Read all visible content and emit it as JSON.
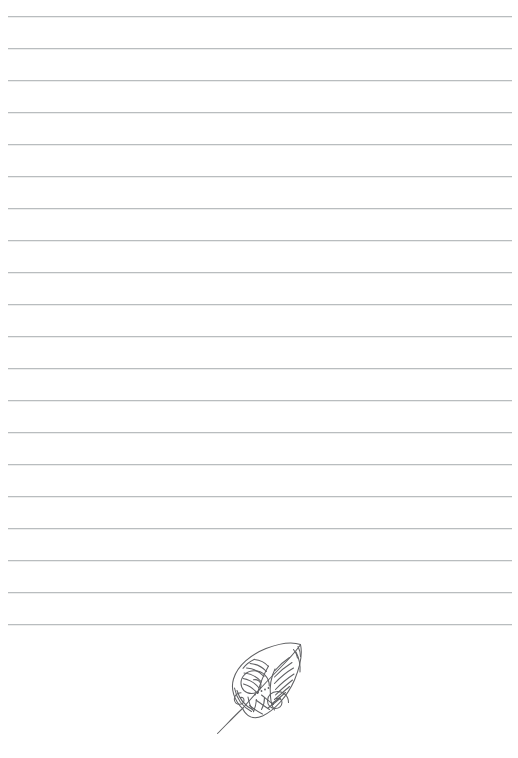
{
  "page": {
    "kind": "lined-notebook-page",
    "width": 518,
    "height": 758,
    "background_color": "#ffffff",
    "title": "Lined Notebook Page",
    "visible_text": ""
  },
  "ruled_lines": {
    "name": "ruled-lines",
    "count": 20,
    "color": "#b9bdbf",
    "thickness_px": 1,
    "spacing_px": 32,
    "first_line_y": 16,
    "last_line_y": 624,
    "left_x": 8,
    "right_x": 512,
    "y_positions": [
      16,
      48,
      80,
      112,
      144,
      176,
      208,
      240,
      272,
      304,
      336,
      368,
      400,
      432,
      464,
      496,
      528,
      560,
      592,
      624
    ]
  },
  "ornament": {
    "name": "leaf-ornament",
    "style": "zentangle-doodle-leaf",
    "ink_color": "#5f6063",
    "bounds": {
      "x": 212,
      "y": 640,
      "width": 96,
      "height": 98
    },
    "tip_point": {
      "x": 301,
      "y": 645
    },
    "stem_end_point": {
      "x": 217,
      "y": 734
    },
    "orientation": "diagonal-tip-upper-right",
    "pattern_regions": [
      "spiral-cluster-lower-left",
      "feather-veins-upper-right",
      "concentric-arc-bands-lower-edge",
      "small-dot-row-center"
    ]
  }
}
